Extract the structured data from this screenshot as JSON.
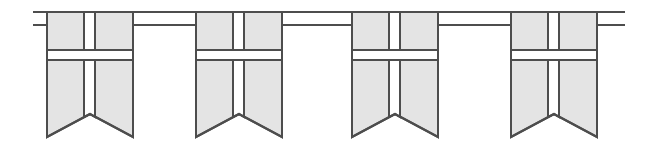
{
  "canvas": {
    "width": 657,
    "height": 146,
    "background_color": "#ffffff",
    "title": "Swallowtail bunting flags with cross emblem"
  },
  "style": {
    "flag_fill_color": "#e4e4e4",
    "flag_stroke_color": "#4d4d4d",
    "cross_color": "#ffffff",
    "cord_color": "#4d4d4d",
    "stroke_width": 2,
    "cord_width": 2
  },
  "cords": [
    {
      "name": "upper-cord",
      "y": 12,
      "x1": 33,
      "x2": 625,
      "label": "upper suspension line"
    },
    {
      "name": "lower-cord",
      "y": 25,
      "x1": 33,
      "x2": 625,
      "label": "lower suspension line"
    }
  ],
  "flag_geometry": {
    "top_y": 12,
    "body_bottom_y": 137,
    "notch_apex_y": 114,
    "width": 86,
    "cross_vertical_x_offset": 37,
    "cross_vertical_width": 11,
    "cross_horizontal_y": 50,
    "cross_horizontal_height": 10
  },
  "flags": [
    {
      "name": "flag-1",
      "x": 47,
      "label": "Flag 1"
    },
    {
      "name": "flag-2",
      "x": 196,
      "label": "Flag 2"
    },
    {
      "name": "flag-3",
      "x": 352,
      "label": "Flag 3"
    },
    {
      "name": "flag-4",
      "x": 511,
      "label": "Flag 4"
    }
  ],
  "counts": {
    "flag_count": 4,
    "cord_count": 2
  }
}
